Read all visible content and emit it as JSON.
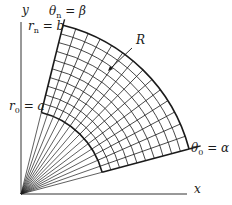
{
  "diagram": {
    "type": "polar-region",
    "origin": {
      "x": 21,
      "y": 194
    },
    "x_axis_end": 187,
    "y_axis_end": 22,
    "inner_radius_px": 84,
    "outer_radius_px": 174,
    "theta_alpha_deg": 15,
    "theta_beta_deg": 76,
    "angular_divisions": 14,
    "radial_divisions": 10,
    "colors": {
      "line": "#1a1a1a",
      "axis": "#333333",
      "background": "#ffffff"
    }
  },
  "labels": {
    "x_axis": "x",
    "y_axis": "y",
    "region": "R",
    "theta_n": {
      "symbol": "θ",
      "sub": "n",
      "rest": " = β"
    },
    "r_n": {
      "symbol": "r",
      "sub": "n",
      "rest": " = b"
    },
    "r_0": {
      "symbol": "r",
      "sub": "0",
      "rest": " = a"
    },
    "theta_0": {
      "symbol": "θ",
      "sub": "0",
      "rest": " = α"
    }
  }
}
